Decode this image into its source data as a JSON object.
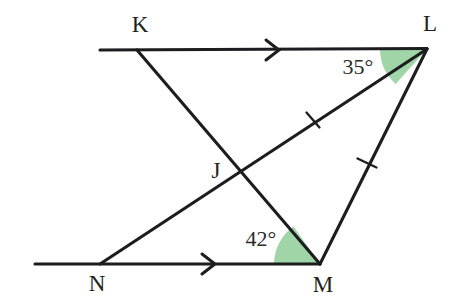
{
  "figure": {
    "type": "geometry-diagram",
    "background_color": "#ffffff",
    "line_color": "#1d1d1f",
    "angle_fill_color": "#9fd5a7",
    "points": {
      "K": {
        "label": "K",
        "x": 137,
        "y": 50,
        "label_x": 140,
        "label_y": 32
      },
      "L": {
        "label": "L",
        "x": 427,
        "y": 49,
        "label_x": 430,
        "label_y": 31
      },
      "J": {
        "label": "J",
        "x": 240,
        "y": 172,
        "label_x": 216,
        "label_y": 178
      },
      "N": {
        "label": "N",
        "x": 100,
        "y": 264,
        "label_x": 97,
        "label_y": 291
      },
      "M": {
        "label": "M",
        "x": 320,
        "y": 264,
        "label_x": 323,
        "label_y": 292
      }
    },
    "segments": [
      {
        "name": "ray-through-K-toward-L",
        "from_x": 100,
        "from_y": 50,
        "to_x": 427,
        "to_y": 49,
        "kind": "parallel-ray-top"
      },
      {
        "name": "ray-through-N-toward-M",
        "from_x": 35,
        "from_y": 264,
        "to_x": 320,
        "to_y": 264,
        "kind": "parallel-ray-bottom"
      },
      {
        "name": "segment-K-M",
        "from_x": 137,
        "from_y": 50,
        "to_x": 320,
        "to_y": 264,
        "kind": "transversal"
      },
      {
        "name": "segment-N-L",
        "from_x": 100,
        "from_y": 264,
        "to_x": 427,
        "to_y": 49,
        "kind": "transversal"
      },
      {
        "name": "segment-L-M",
        "from_x": 427,
        "from_y": 49,
        "to_x": 320,
        "to_y": 264,
        "kind": "side"
      }
    ],
    "parallel_arrow_marks": [
      {
        "name": "arrow-mark-top",
        "x": 277,
        "y": 50,
        "direction": "right"
      },
      {
        "name": "arrow-mark-bottom",
        "x": 213,
        "y": 264,
        "direction": "right"
      }
    ],
    "congruence_ticks": [
      {
        "name": "tick-on-segment-J-L",
        "x": 313,
        "y": 120,
        "on": "segment-N-L"
      },
      {
        "name": "tick-on-segment-L-M",
        "x": 367,
        "y": 163,
        "on": "segment-L-M"
      }
    ],
    "angles": [
      {
        "name": "angle-at-L",
        "label": "35°",
        "value": 35,
        "unit": "degrees",
        "vertex": "L",
        "between": [
          "L-toward-K",
          "L-toward-N"
        ],
        "label_x": 358,
        "label_y": 74,
        "fill": "#9fd5a7"
      },
      {
        "name": "angle-at-M",
        "label": "42°",
        "value": 42,
        "unit": "degrees",
        "vertex": "M",
        "between": [
          "M-toward-N",
          "M-toward-K"
        ],
        "label_x": 261,
        "label_y": 246,
        "fill": "#9fd5a7"
      }
    ]
  }
}
